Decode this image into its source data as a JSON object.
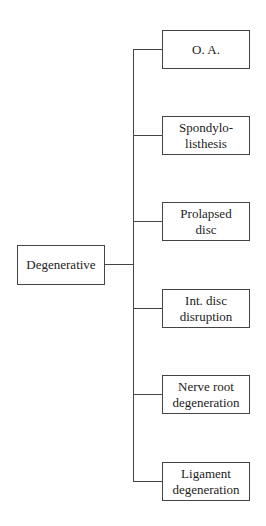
{
  "diagram": {
    "root": {
      "label": "Degenerative"
    },
    "children": [
      {
        "label": "O. A."
      },
      {
        "label": "Spondylo-\nlisthesis"
      },
      {
        "label": "Prolapsed\ndisc"
      },
      {
        "label": "Int. disc\ndisruption"
      },
      {
        "label": "Nerve root\ndegeneration"
      },
      {
        "label": "Ligament\ndegeneration"
      }
    ]
  }
}
